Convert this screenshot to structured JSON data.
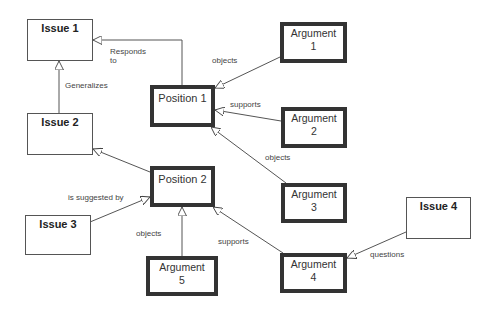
{
  "diagram": {
    "type": "IBIS argument map",
    "nodes": {
      "issue1": {
        "label": "Issue 1",
        "kind": "issue"
      },
      "issue2": {
        "label": "Issue 2",
        "kind": "issue"
      },
      "issue3": {
        "label": "Issue 3",
        "kind": "issue"
      },
      "issue4": {
        "label": "Issue 4",
        "kind": "issue"
      },
      "position1": {
        "label": "Position 1",
        "kind": "position"
      },
      "position2": {
        "label": "Position 2",
        "kind": "position"
      },
      "argument1": {
        "label": "Argument\n1",
        "kind": "argument"
      },
      "argument2": {
        "label": "Argument\n2",
        "kind": "argument"
      },
      "argument3": {
        "label": "Argument\n3",
        "kind": "argument"
      },
      "argument4": {
        "label": "Argument\n4",
        "kind": "argument"
      },
      "argument5": {
        "label": "Argument\n5",
        "kind": "argument"
      }
    },
    "edges": [
      {
        "from": "position1",
        "to": "issue1",
        "label": "Responds\nto"
      },
      {
        "from": "issue2",
        "to": "issue1",
        "label": "Generalizes"
      },
      {
        "from": "argument1",
        "to": "position1",
        "label": "objects"
      },
      {
        "from": "argument2",
        "to": "position1",
        "label": "supports"
      },
      {
        "from": "argument3",
        "to": "position1",
        "label": "objects"
      },
      {
        "from": "position2",
        "to": "issue2",
        "label": ""
      },
      {
        "from": "issue3",
        "to": "position2",
        "label": "is suggested by"
      },
      {
        "from": "argument5",
        "to": "position2",
        "label": "objects"
      },
      {
        "from": "argument4",
        "to": "position2",
        "label": "supports"
      },
      {
        "from": "issue4",
        "to": "argument4",
        "label": "questions"
      }
    ],
    "colors": {
      "line": "#444444",
      "border": "#333333",
      "background": "#ffffff"
    }
  }
}
